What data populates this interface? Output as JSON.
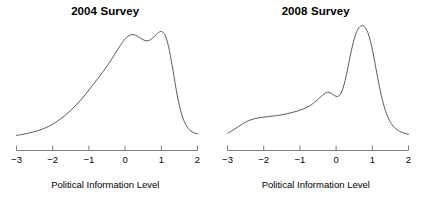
{
  "figure": {
    "background": "#ffffff",
    "curve_color": "#4a4a4a",
    "axis_color": "#6e6e6e"
  },
  "panels": [
    {
      "title": "2004 Survey",
      "xlabel": "Political Information Level"
    },
    {
      "title": "2008 Survey",
      "xlabel": "Political Information Level"
    }
  ],
  "axis": {
    "ticks": [
      "-3",
      "-2",
      "-1",
      "0",
      "1",
      "2"
    ],
    "tick_values": [
      -3,
      -2,
      -1,
      0,
      1,
      2
    ]
  },
  "chart_data": [
    {
      "type": "line",
      "title": "2004 Survey",
      "xlabel": "Political Information Level",
      "ylabel": "",
      "xlim": [
        -3,
        2
      ],
      "ylim": [
        0,
        0.52
      ],
      "grid": false,
      "legend": "none",
      "xticks": [
        -3,
        -2,
        -1,
        0,
        1,
        2
      ],
      "series": [
        {
          "name": "2004 density",
          "x": [
            -3.0,
            -2.85,
            -2.7,
            -2.55,
            -2.4,
            -2.25,
            -2.1,
            -1.95,
            -1.8,
            -1.65,
            -1.5,
            -1.35,
            -1.2,
            -1.05,
            -0.9,
            -0.75,
            -0.6,
            -0.45,
            -0.3,
            -0.15,
            0.0,
            0.1,
            0.2,
            0.3,
            0.4,
            0.5,
            0.6,
            0.7,
            0.8,
            0.9,
            1.0,
            1.1,
            1.2,
            1.3,
            1.4,
            1.5,
            1.6,
            1.7,
            1.8,
            1.9,
            2.0
          ],
          "y": [
            0.012,
            0.016,
            0.021,
            0.027,
            0.034,
            0.043,
            0.054,
            0.068,
            0.085,
            0.104,
            0.126,
            0.151,
            0.178,
            0.208,
            0.24,
            0.272,
            0.305,
            0.34,
            0.378,
            0.418,
            0.452,
            0.466,
            0.472,
            0.468,
            0.458,
            0.448,
            0.443,
            0.448,
            0.462,
            0.478,
            0.486,
            0.47,
            0.418,
            0.33,
            0.232,
            0.148,
            0.09,
            0.054,
            0.034,
            0.024,
            0.019
          ]
        }
      ]
    },
    {
      "type": "line",
      "title": "2008 Survey",
      "xlabel": "Political Information Level",
      "ylabel": "",
      "xlim": [
        -3,
        2
      ],
      "ylim": [
        0,
        0.52
      ],
      "grid": false,
      "legend": "none",
      "xticks": [
        -3,
        -2,
        -1,
        0,
        1,
        2
      ],
      "series": [
        {
          "name": "2008 density",
          "x": [
            -3.0,
            -2.85,
            -2.7,
            -2.55,
            -2.4,
            -2.25,
            -2.1,
            -1.95,
            -1.8,
            -1.65,
            -1.5,
            -1.35,
            -1.2,
            -1.05,
            -0.9,
            -0.75,
            -0.6,
            -0.45,
            -0.3,
            -0.2,
            -0.1,
            0.0,
            0.1,
            0.2,
            0.3,
            0.4,
            0.5,
            0.6,
            0.7,
            0.8,
            0.9,
            1.0,
            1.1,
            1.2,
            1.3,
            1.4,
            1.5,
            1.6,
            1.7,
            1.8,
            1.9,
            2.0
          ],
          "y": [
            0.022,
            0.036,
            0.052,
            0.068,
            0.08,
            0.088,
            0.093,
            0.096,
            0.099,
            0.102,
            0.106,
            0.111,
            0.117,
            0.124,
            0.133,
            0.145,
            0.162,
            0.184,
            0.205,
            0.208,
            0.2,
            0.19,
            0.196,
            0.232,
            0.3,
            0.382,
            0.452,
            0.495,
            0.512,
            0.505,
            0.47,
            0.405,
            0.318,
            0.232,
            0.16,
            0.108,
            0.072,
            0.05,
            0.036,
            0.027,
            0.021,
            0.017
          ]
        }
      ]
    }
  ]
}
